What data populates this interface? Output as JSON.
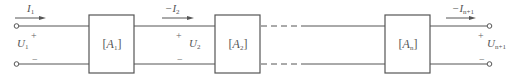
{
  "colors": {
    "line": "#555555",
    "text": "#555555",
    "background": "#ffffff"
  },
  "input_port": {
    "current": {
      "symbol": "I",
      "sub": "1"
    },
    "voltage": {
      "symbol": "U",
      "sub": "1"
    },
    "plus": "+",
    "minus": "−"
  },
  "interstage_port": {
    "current": {
      "prefix": "−",
      "symbol": "I",
      "sub": "2"
    },
    "voltage": {
      "symbol": "U",
      "sub": "2"
    },
    "plus": "+",
    "minus": "−"
  },
  "output_port": {
    "current": {
      "prefix": "−",
      "symbol": "I",
      "sub": "n+1"
    },
    "voltage": {
      "symbol": "U",
      "sub": "n+1"
    },
    "plus": "+",
    "minus": "−"
  },
  "blocks": [
    {
      "open": "[",
      "symbol": "A",
      "sub": "1",
      "close": "]"
    },
    {
      "open": "[",
      "symbol": "A",
      "sub": "2",
      "close": "]"
    },
    {
      "open": "[",
      "symbol": "A",
      "sub": "n",
      "close": "]"
    }
  ]
}
